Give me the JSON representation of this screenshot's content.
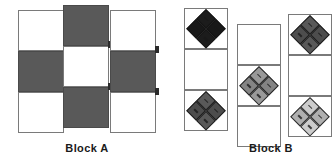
{
  "figure": {
    "background_color": "#ffffff",
    "width": 335,
    "height": 162
  },
  "palette": {
    "white": "#ffffff",
    "light_gray": "#cccccc",
    "medium_gray": "#999999",
    "dark_gray": "#595959",
    "near_black": "#1c1c1c",
    "outline": "#7a7a7a",
    "tab": "#2b2b2b",
    "text": "#1a1a1a"
  },
  "blocks": [
    {
      "id": "block-a",
      "caption": "Block A",
      "caption_x": 57,
      "caption_y": 142,
      "caption_width": 60,
      "unit_type": "plain-square",
      "columns": [
        {
          "id": "block-a-column-1",
          "x": 18,
          "y": 10,
          "cell_w": 46,
          "cell_h": 41,
          "cells": [
            {
              "id": "a1-c1",
              "fill": "white",
              "label": "white square"
            },
            {
              "id": "a1-c2",
              "fill": "dark_gray",
              "label": "dark square"
            },
            {
              "id": "a1-c3",
              "fill": "white",
              "label": "white square"
            }
          ],
          "tabs": [
            {
              "id": "a1-tab-1",
              "dx": 45,
              "dy": 36
            },
            {
              "id": "a1-tab-2",
              "dx": 45,
              "dy": 78
            }
          ]
        },
        {
          "id": "block-a-column-2",
          "x": 63,
          "y": 5,
          "cell_w": 46,
          "cell_h": 41,
          "cells": [
            {
              "id": "a2-c1",
              "fill": "dark_gray",
              "label": "dark square"
            },
            {
              "id": "a2-c2",
              "fill": "white",
              "label": "white square"
            },
            {
              "id": "a2-c3",
              "fill": "dark_gray",
              "label": "dark square"
            }
          ],
          "tabs": [
            {
              "id": "a2-tab-1",
              "dx": 45,
              "dy": 36
            },
            {
              "id": "a2-tab-2",
              "dx": 45,
              "dy": 78
            }
          ]
        },
        {
          "id": "block-a-column-3",
          "x": 110,
          "y": 10,
          "cell_w": 46,
          "cell_h": 41,
          "cells": [
            {
              "id": "a3-c1",
              "fill": "white",
              "label": "white square"
            },
            {
              "id": "a3-c2",
              "fill": "dark_gray",
              "label": "dark square"
            },
            {
              "id": "a3-c3",
              "fill": "white",
              "label": "white square"
            }
          ],
          "tabs": [
            {
              "id": "a3-tab-1",
              "dx": 45,
              "dy": 36
            },
            {
              "id": "a3-tab-2",
              "dx": 45,
              "dy": 78
            }
          ]
        }
      ]
    },
    {
      "id": "block-b",
      "caption": "Block B",
      "caption_x": 241,
      "caption_y": 142,
      "caption_width": 60,
      "unit_type": "quarter-square-triangle-on-point",
      "columns": [
        {
          "id": "block-b-column-1",
          "x": 184,
          "y": 8,
          "cell_w": 44,
          "cell_h": 41,
          "cells": [
            {
              "id": "b1-c1",
              "fill": "white",
              "diamond": "near_black",
              "label": "dark on-point unit"
            },
            {
              "id": "b1-c2",
              "fill": "white",
              "diamond": null,
              "label": "empty square"
            },
            {
              "id": "b1-c3",
              "fill": "white",
              "diamond": "dark_gray",
              "label": "gray on-point unit"
            }
          ],
          "tabs": []
        },
        {
          "id": "block-b-column-2",
          "x": 237,
          "y": 24,
          "cell_w": 44,
          "cell_h": 41,
          "cells": [
            {
              "id": "b2-c1",
              "fill": "white",
              "diamond": null,
              "label": "empty square"
            },
            {
              "id": "b2-c2",
              "fill": "white",
              "diamond": "medium_gray",
              "label": "medium gray on-point unit"
            },
            {
              "id": "b2-c3",
              "fill": "white",
              "diamond": null,
              "label": "empty square"
            }
          ],
          "tabs": []
        },
        {
          "id": "block-b-column-3",
          "x": 288,
          "y": 14,
          "cell_w": 44,
          "cell_h": 41,
          "cells": [
            {
              "id": "b3-c1",
              "fill": "white",
              "diamond": "dark_gray",
              "label": "gray on-point unit"
            },
            {
              "id": "b3-c2",
              "fill": "white",
              "diamond": null,
              "label": "empty square"
            },
            {
              "id": "b3-c3",
              "fill": "white",
              "diamond": "light_gray",
              "label": "light gray on-point unit"
            }
          ],
          "tabs": []
        }
      ]
    }
  ]
}
